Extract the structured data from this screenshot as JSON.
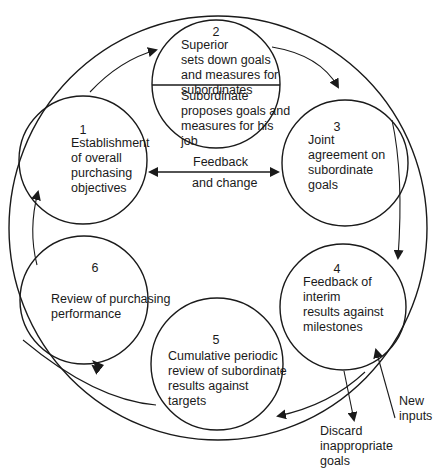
{
  "diagram": {
    "type": "cycle",
    "stages": [
      {
        "number": "1",
        "text": "Establishment\nof overall\npurchasing\nobjectives"
      },
      {
        "number": "2",
        "text_top": "Superior\nsets down goals\nand measures for\nsubordinates",
        "text_bottom": "Subordinate\nproposes goals and\nmeasures for his\njob"
      },
      {
        "number": "3",
        "text": "Joint\nagreement on\nsubordinate\ngoals"
      },
      {
        "number": "4",
        "text": "Feedback of\ninterim\nresults against\nmilestones"
      },
      {
        "number": "5",
        "text": "Cumulative periodic\nreview of subordinate\nresults against\ntargets"
      },
      {
        "number": "6",
        "text": "Review of purchasing\nperformance"
      }
    ],
    "feedback_label_1": "Feedback",
    "feedback_label_2": "and change",
    "new_inputs": "New\ninputs",
    "discard": "Discard\ninappropriate\ngoals",
    "stroke_color": "#1a1a1a"
  }
}
